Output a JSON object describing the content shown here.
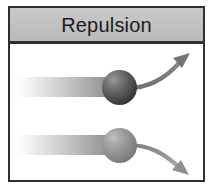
{
  "figure": {
    "title": "Repulsion",
    "kind": "physics-illustration",
    "colors": {
      "frame_border": "#2e2e2e",
      "header_background": "#c2c2c2",
      "body_background": "#ffffff",
      "title_text": "#1c1c1c",
      "beam_gray": "#8e8e8e",
      "arrow_gray": "#6b6b6b",
      "sphere_top_dark": "#2b2b2b",
      "sphere_bottom_light": "#949494"
    }
  },
  "header": {
    "label": "Repulsion"
  },
  "body": {
    "elements": [
      {
        "id": "beam-top",
        "name": "incoming-beam-top",
        "type": "gradient-beam",
        "direction": "left-to-right",
        "label": ""
      },
      {
        "id": "sphere-top",
        "name": "particle-sphere-top",
        "type": "sphere",
        "shade": "dark",
        "label": ""
      },
      {
        "id": "arrow-top",
        "name": "deflection-arrow-up",
        "type": "curved-arrow",
        "direction": "up-right",
        "label": ""
      },
      {
        "id": "beam-bottom",
        "name": "incoming-beam-bottom",
        "type": "gradient-beam",
        "direction": "left-to-right",
        "label": ""
      },
      {
        "id": "sphere-bottom",
        "name": "particle-sphere-bottom",
        "type": "sphere",
        "shade": "light",
        "label": ""
      },
      {
        "id": "arrow-bottom",
        "name": "deflection-arrow-down",
        "type": "curved-arrow",
        "direction": "down-right",
        "label": ""
      }
    ]
  }
}
